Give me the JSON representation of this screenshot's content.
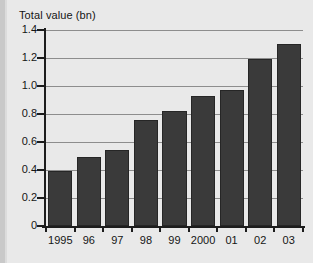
{
  "chart_data": {
    "type": "bar",
    "title": "Total value (bn)",
    "xlabel": "",
    "ylabel": "",
    "categories": [
      "1995",
      "96",
      "97",
      "98",
      "99",
      "2000",
      "01",
      "02",
      "03"
    ],
    "values": [
      0.39,
      0.49,
      0.54,
      0.76,
      0.82,
      0.93,
      0.97,
      1.19,
      1.3
    ],
    "ylim": [
      0,
      1.4
    ],
    "ytick_labels": [
      "0",
      "0.2",
      "0.4",
      "0.6",
      "0.8",
      "1.0",
      "1.2",
      "1.4"
    ],
    "ytick_values": [
      0,
      0.2,
      0.4,
      0.6,
      0.8,
      1.0,
      1.2,
      1.4
    ],
    "grid": "horizontal",
    "legend": "none",
    "series": [
      {
        "name": "Total value (bn)",
        "values": [
          0.39,
          0.49,
          0.54,
          0.76,
          0.82,
          0.93,
          0.97,
          1.19,
          1.3
        ]
      }
    ],
    "colors": {
      "bar_fill": "#3a3a3a",
      "bar_edge": "#262626",
      "background": "#e9e9e9",
      "gridline": "#8d8d8d",
      "axis": "#1d1d1d",
      "text": "#151515"
    }
  }
}
